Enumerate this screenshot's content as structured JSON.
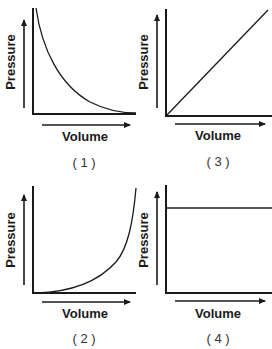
{
  "panels": [
    {
      "caption": "( 1 )",
      "xlabel": "Volume",
      "ylabel": "Pressure",
      "relationship": "inverse (hyperbolic decay)"
    },
    {
      "caption": "( 3 )",
      "xlabel": "Volume",
      "ylabel": "Pressure",
      "relationship": "direct linear"
    },
    {
      "caption": "( 2 )",
      "xlabel": "Volume",
      "ylabel": "Pressure",
      "relationship": "exponential growth"
    },
    {
      "caption": "( 4 )",
      "xlabel": "Volume",
      "ylabel": "Pressure",
      "relationship": "constant"
    }
  ]
}
